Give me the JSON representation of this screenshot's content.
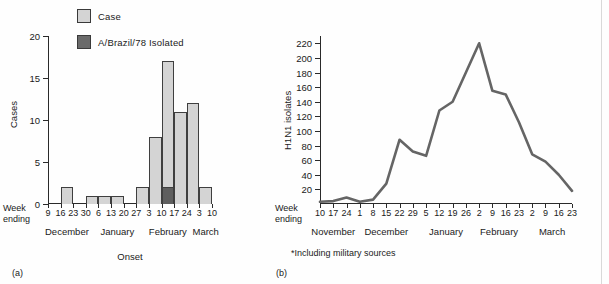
{
  "legend": {
    "items": [
      {
        "label": "Case",
        "color": "#d4d4d4",
        "icon": "square-swatch-light"
      },
      {
        "label": "A/Brazil/78 Isolated",
        "color": "#6a6a6a",
        "icon": "square-swatch-dark"
      }
    ]
  },
  "panel_a": {
    "tag": "(a)",
    "week_ending_label_line1": "Week",
    "week_ending_label_line2": "ending",
    "xlabel": "Onset",
    "ylabel": "Cases"
  },
  "panel_b": {
    "tag": "(b)",
    "week_ending_label_line1": "Week",
    "week_ending_label_line2": "ending",
    "ylabel": "H1N1 isolates",
    "footnote": "*Including military sources"
  },
  "chart_data": [
    {
      "type": "bar",
      "panel": "(a)",
      "title": "",
      "xlabel": "Onset",
      "ylabel": "Cases",
      "ylim": [
        0,
        20
      ],
      "yticks": [
        0,
        5,
        10,
        15,
        20
      ],
      "grid": false,
      "legend_position": "top-left",
      "categories": [
        "9",
        "16",
        "23",
        "30",
        "6",
        "13",
        "20",
        "27",
        "3",
        "10",
        "17",
        "24",
        "3",
        "10"
      ],
      "month_groups": [
        {
          "label": "December",
          "ticks": [
            "9",
            "16",
            "23",
            "30"
          ]
        },
        {
          "label": "January",
          "ticks": [
            "6",
            "13",
            "20",
            "27"
          ]
        },
        {
          "label": "February",
          "ticks": [
            "3",
            "10",
            "17",
            "24"
          ]
        },
        {
          "label": "March",
          "ticks": [
            "3",
            "10"
          ]
        }
      ],
      "series": [
        {
          "name": "Case",
          "color": "#d4d4d4",
          "bins": [
            {
              "start": "9",
              "end": "16",
              "value": 0
            },
            {
              "start": "16",
              "end": "23",
              "value": 2
            },
            {
              "start": "23",
              "end": "30",
              "value": 0
            },
            {
              "start": "30",
              "end": "6",
              "value": 1
            },
            {
              "start": "6",
              "end": "13",
              "value": 1
            },
            {
              "start": "13",
              "end": "20",
              "value": 1
            },
            {
              "start": "20",
              "end": "27",
              "value": 0
            },
            {
              "start": "27",
              "end": "3",
              "value": 2
            },
            {
              "start": "3",
              "end": "10",
              "value": 8
            },
            {
              "start": "10",
              "end": "17",
              "value": 17
            },
            {
              "start": "17",
              "end": "24",
              "value": 11
            },
            {
              "start": "24",
              "end": "3",
              "value": 12
            },
            {
              "start": "3",
              "end": "10",
              "value": 2
            }
          ]
        },
        {
          "name": "A/Brazil/78 Isolated",
          "color": "#5e5e5e",
          "bins": [
            {
              "start": "10",
              "end": "17",
              "value": 2
            }
          ]
        }
      ]
    },
    {
      "type": "line",
      "panel": "(b)",
      "title": "",
      "xlabel": "",
      "ylabel": "H1N1 isolates",
      "ylim": [
        0,
        230
      ],
      "yticks": [
        20,
        40,
        60,
        80,
        100,
        120,
        140,
        160,
        180,
        200,
        220
      ],
      "grid": false,
      "footnote": "*Including military sources",
      "line_color": "#656565",
      "x": [
        "10",
        "17",
        "24",
        "1",
        "8",
        "15",
        "22",
        "29",
        "5",
        "12",
        "19",
        "26",
        "2",
        "9",
        "16",
        "23",
        "2",
        "9",
        "16",
        "23"
      ],
      "month_groups": [
        {
          "label": "November",
          "ticks": [
            "10",
            "17",
            "24"
          ]
        },
        {
          "label": "December",
          "ticks": [
            "1",
            "8",
            "15",
            "22",
            "29"
          ]
        },
        {
          "label": "January",
          "ticks": [
            "5",
            "12",
            "19",
            "26"
          ]
        },
        {
          "label": "February",
          "ticks": [
            "2",
            "9",
            "16",
            "23"
          ]
        },
        {
          "label": "March",
          "ticks": [
            "2",
            "9",
            "16",
            "23"
          ]
        }
      ],
      "values": [
        3,
        4,
        9,
        3,
        6,
        28,
        88,
        72,
        66,
        128,
        140,
        180,
        220,
        155,
        150,
        112,
        68,
        58,
        40,
        18
      ]
    }
  ]
}
